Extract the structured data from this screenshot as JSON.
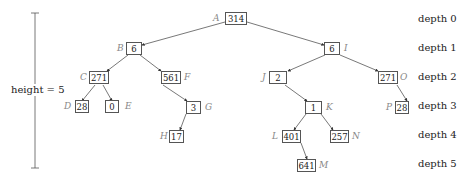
{
  "diagram": {
    "type": "binary-tree",
    "height_label": "height = 5",
    "depth_labels": [
      "depth 0",
      "depth 1",
      "depth 2",
      "depth 3",
      "depth 4",
      "depth 5"
    ],
    "nodes": [
      {
        "id": "A",
        "label": "A",
        "value": "314",
        "depth": 0,
        "parent": null
      },
      {
        "id": "B",
        "label": "B",
        "value": "6",
        "depth": 1,
        "parent": "A"
      },
      {
        "id": "I",
        "label": "I",
        "value": "6",
        "depth": 1,
        "parent": "A"
      },
      {
        "id": "C",
        "label": "C",
        "value": "271",
        "depth": 2,
        "parent": "B"
      },
      {
        "id": "F",
        "label": "F",
        "value": "561",
        "depth": 2,
        "parent": "B"
      },
      {
        "id": "J",
        "label": "J",
        "value": "2",
        "depth": 2,
        "parent": "I"
      },
      {
        "id": "O",
        "label": "O",
        "value": "271",
        "depth": 2,
        "parent": "I"
      },
      {
        "id": "D",
        "label": "D",
        "value": "28",
        "depth": 3,
        "parent": "C"
      },
      {
        "id": "E",
        "label": "E",
        "value": "0",
        "depth": 3,
        "parent": "C"
      },
      {
        "id": "G",
        "label": "G",
        "value": "3",
        "depth": 3,
        "parent": "F"
      },
      {
        "id": "K",
        "label": "K",
        "value": "1",
        "depth": 3,
        "parent": "J"
      },
      {
        "id": "P",
        "label": "P",
        "value": "28",
        "depth": 3,
        "parent": "O"
      },
      {
        "id": "H",
        "label": "H",
        "value": "17",
        "depth": 4,
        "parent": "G"
      },
      {
        "id": "L",
        "label": "L",
        "value": "401",
        "depth": 4,
        "parent": "K"
      },
      {
        "id": "N",
        "label": "N",
        "value": "257",
        "depth": 4,
        "parent": "K"
      },
      {
        "id": "M",
        "label": "M",
        "value": "641",
        "depth": 5,
        "parent": "L"
      }
    ]
  }
}
